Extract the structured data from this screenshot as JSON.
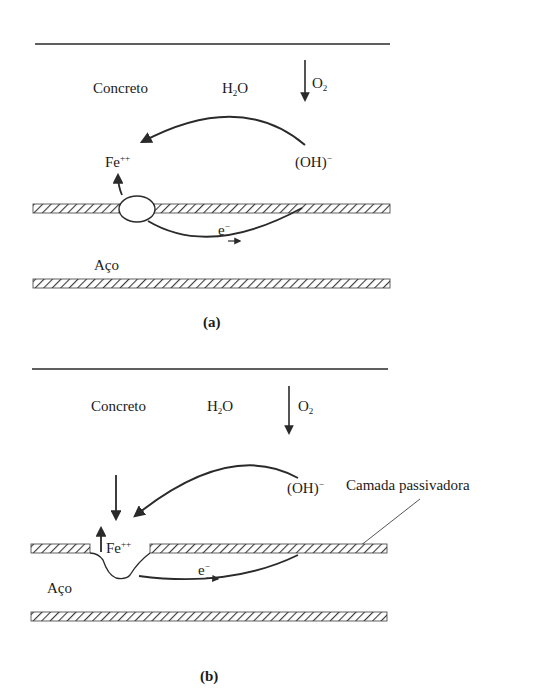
{
  "figure_a": {
    "caption": "(a)",
    "labels": {
      "concrete": "Concreto",
      "water_main": "H",
      "water_sub": "2",
      "water_end": "O",
      "oxygen_main": "O",
      "oxygen_sub": "2",
      "hydroxide_main": "(OH)",
      "hydroxide_sup": "−",
      "iron_main": "Fe",
      "iron_sup": "++",
      "electron_main": "e",
      "electron_sup": "−",
      "steel": "Aço"
    }
  },
  "figure_b": {
    "caption": "(b)",
    "labels": {
      "concrete": "Concreto",
      "water_main": "H",
      "water_sub": "2",
      "water_end": "O",
      "oxygen_main": "O",
      "oxygen_sub": "2",
      "hydroxide_main": "(OH)",
      "hydroxide_sup": "−",
      "iron_main": "Fe",
      "iron_sup": "++",
      "electron_main": "e",
      "electron_sup": "−",
      "steel": "Aço",
      "passive_layer": "Camada passivadora"
    }
  },
  "colors": {
    "ink": "#2a2a2a",
    "background": "#ffffff"
  }
}
